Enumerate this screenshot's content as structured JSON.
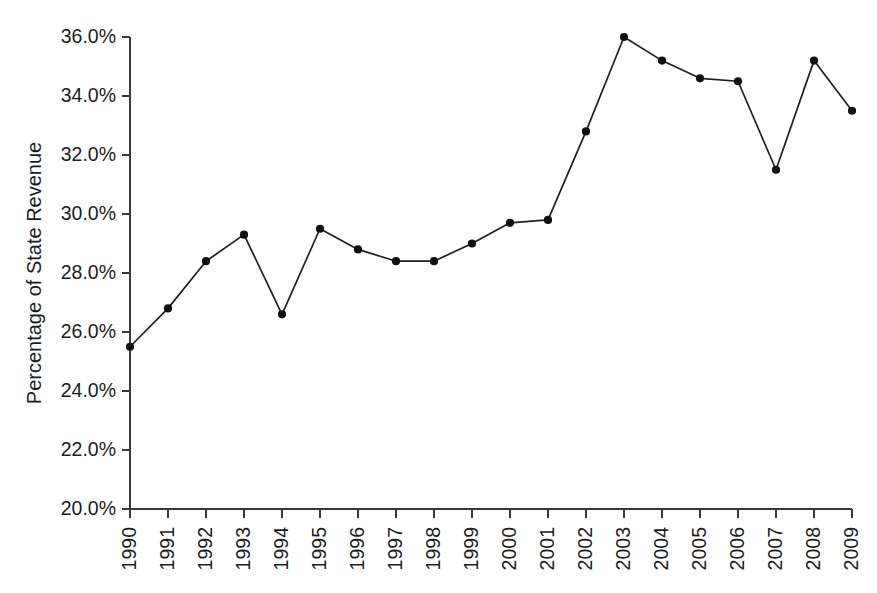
{
  "chart_data": {
    "type": "line",
    "title": "",
    "subtitle": "",
    "xlabel": "",
    "ylabel": "Percentage of State Revenue",
    "x": [
      1990,
      1991,
      1992,
      1993,
      1994,
      1995,
      1996,
      1997,
      1998,
      1999,
      2000,
      2001,
      2002,
      2003,
      2004,
      2005,
      2006,
      2007,
      2008,
      2009
    ],
    "categories": [
      "1990",
      "1991",
      "1992",
      "1993",
      "1994",
      "1995",
      "1996",
      "1997",
      "1998",
      "1999",
      "2000",
      "2001",
      "2002",
      "2003",
      "2004",
      "2005",
      "2006",
      "2007",
      "2008",
      "2009"
    ],
    "values": [
      25.5,
      26.8,
      28.4,
      29.3,
      26.6,
      29.5,
      28.8,
      28.4,
      28.4,
      29.0,
      29.7,
      29.8,
      32.8,
      36.0,
      35.2,
      34.6,
      34.5,
      31.5,
      35.2,
      33.5
    ],
    "series": [
      {
        "name": "Percentage of State Revenue",
        "values": [
          25.5,
          26.8,
          28.4,
          29.3,
          26.6,
          29.5,
          28.8,
          28.4,
          28.4,
          29.0,
          29.7,
          29.8,
          32.8,
          36.0,
          35.2,
          34.6,
          34.5,
          31.5,
          35.2,
          33.5
        ],
        "line_color": "#1f1f1f",
        "marker_color": "#111111",
        "marker": "circle"
      }
    ],
    "ylim": [
      20.0,
      36.0
    ],
    "ytick_values": [
      20.0,
      22.0,
      24.0,
      26.0,
      28.0,
      30.0,
      32.0,
      34.0,
      36.0
    ],
    "ytick_labels": [
      "20.0%",
      "22.0%",
      "24.0%",
      "26.0%",
      "28.0%",
      "30.0%",
      "32.0%",
      "34.0%",
      "36.0%"
    ],
    "xtick_labels": [
      "1990",
      "1991",
      "1992",
      "1993",
      "1994",
      "1995",
      "1996",
      "1997",
      "1998",
      "1999",
      "2000",
      "2001",
      "2002",
      "2003",
      "2004",
      "2005",
      "2006",
      "2007",
      "2008",
      "2009"
    ],
    "xtick_rotation": -90,
    "grid": false,
    "legend": false,
    "legend_position": "none",
    "annotations": [],
    "background_color": "#ffffff",
    "axis_color": "#3a3a3a",
    "text_color": "#1c1c1c"
  },
  "layout": {
    "plot_left": 130,
    "plot_right": 852,
    "plot_top": 37,
    "plot_bottom": 509
  }
}
